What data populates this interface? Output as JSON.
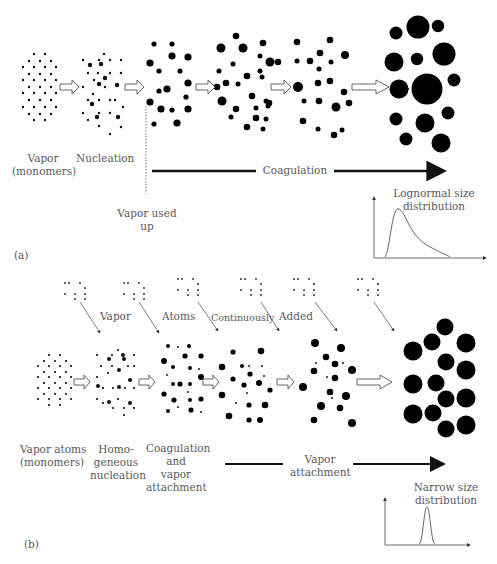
{
  "panel_a": {
    "tag": "(a)",
    "labels": {
      "vapor": "Vapor",
      "monomers": "(monomers)",
      "nucleation": "Nucleation",
      "vapor_used": "Vapor used",
      "up": "up",
      "coagulation": "Coagulation",
      "dist_line1": "Lognormal size",
      "dist_line2": "distribution"
    },
    "distribution_type": "lognormal"
  },
  "panel_b": {
    "tag": "(b)",
    "top_words": [
      "Vapor",
      "Atoms",
      "Continuously",
      "Added"
    ],
    "labels": {
      "vapor_atoms": "Vapor atoms",
      "monomers": "(monomers)",
      "homo1": "Homo-",
      "homo2": "geneous",
      "homo3": "nucleation",
      "coag1": "Coagulation",
      "coag2": "and",
      "coag3": "vapor",
      "coag4": "attachment",
      "attach1": "Vapor",
      "attach2": "attachment",
      "dist_line1": "Narrow size",
      "dist_line2": "distribution"
    },
    "distribution_type": "narrow"
  }
}
